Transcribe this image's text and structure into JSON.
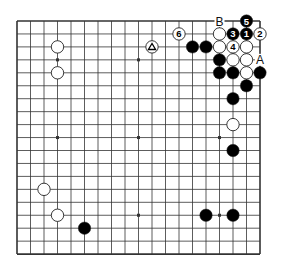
{
  "diagram": {
    "type": "go-board",
    "board_size": 19,
    "visible_region": {
      "cols": [
        0,
        18
      ],
      "rows": [
        0,
        18
      ]
    },
    "colors": {
      "background": "#ffffff",
      "grid": "#333333",
      "black_stone": "#000000",
      "white_stone": "#ffffff",
      "stone_outline": "#222222",
      "label": "#111111"
    },
    "star_points": [
      [
        3,
        3
      ],
      [
        9,
        3
      ],
      [
        15,
        3
      ],
      [
        3,
        9
      ],
      [
        9,
        9
      ],
      [
        15,
        9
      ],
      [
        3,
        15
      ],
      [
        9,
        15
      ],
      [
        15,
        15
      ]
    ],
    "stones": [
      {
        "col": 17,
        "row": 0,
        "color": "black",
        "label": "5"
      },
      {
        "col": 12,
        "row": 1,
        "color": "white",
        "label": "6"
      },
      {
        "col": 15,
        "row": 1,
        "color": "white",
        "label": ""
      },
      {
        "col": 16,
        "row": 1,
        "color": "black",
        "label": "3"
      },
      {
        "col": 17,
        "row": 1,
        "color": "black",
        "label": "1"
      },
      {
        "col": 18,
        "row": 1,
        "color": "white",
        "label": "2"
      },
      {
        "col": 3,
        "row": 2,
        "color": "white",
        "label": ""
      },
      {
        "col": 10,
        "row": 2,
        "color": "white",
        "label": "△"
      },
      {
        "col": 13,
        "row": 2,
        "color": "black",
        "label": ""
      },
      {
        "col": 14,
        "row": 2,
        "color": "black",
        "label": ""
      },
      {
        "col": 15,
        "row": 2,
        "color": "white",
        "label": ""
      },
      {
        "col": 16,
        "row": 2,
        "color": "white",
        "label": "4"
      },
      {
        "col": 17,
        "row": 2,
        "color": "white",
        "label": ""
      },
      {
        "col": 15,
        "row": 3,
        "color": "black",
        "label": ""
      },
      {
        "col": 16,
        "row": 3,
        "color": "white",
        "label": ""
      },
      {
        "col": 17,
        "row": 3,
        "color": "white",
        "label": ""
      },
      {
        "col": 3,
        "row": 4,
        "color": "white",
        "label": ""
      },
      {
        "col": 15,
        "row": 4,
        "color": "black",
        "label": ""
      },
      {
        "col": 16,
        "row": 4,
        "color": "black",
        "label": ""
      },
      {
        "col": 17,
        "row": 4,
        "color": "white",
        "label": ""
      },
      {
        "col": 18,
        "row": 4,
        "color": "black",
        "label": ""
      },
      {
        "col": 17,
        "row": 5,
        "color": "black",
        "label": ""
      },
      {
        "col": 16,
        "row": 6,
        "color": "black",
        "label": ""
      },
      {
        "col": 16,
        "row": 8,
        "color": "white",
        "label": ""
      },
      {
        "col": 16,
        "row": 10,
        "color": "black",
        "label": ""
      },
      {
        "col": 2,
        "row": 13,
        "color": "white",
        "label": ""
      },
      {
        "col": 3,
        "row": 15,
        "color": "white",
        "label": ""
      },
      {
        "col": 14,
        "row": 15,
        "color": "black",
        "label": ""
      },
      {
        "col": 16,
        "row": 15,
        "color": "black",
        "label": ""
      },
      {
        "col": 5,
        "row": 16,
        "color": "black",
        "label": ""
      }
    ],
    "point_labels": [
      {
        "col": 15,
        "row": 0,
        "text": "B"
      },
      {
        "col": 18,
        "row": 3,
        "text": "A"
      }
    ]
  }
}
